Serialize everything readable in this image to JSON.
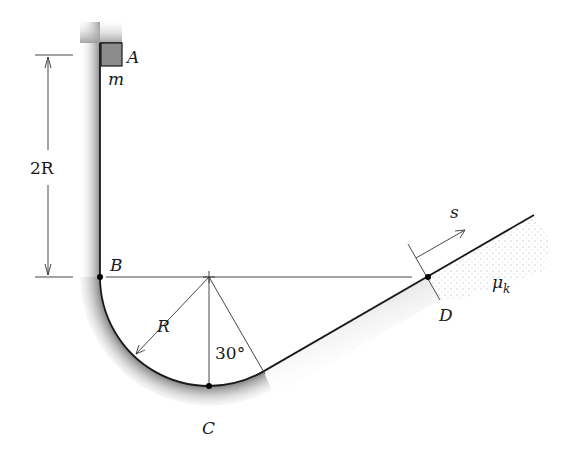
{
  "diagram": {
    "type": "mechanics-track",
    "labels": {
      "point_a": "A",
      "mass": "m",
      "point_b": "B",
      "point_c": "C",
      "point_d": "D",
      "height_dimension": "2R",
      "radius": "R",
      "angle": "30°",
      "distance": "s",
      "friction_coefficient": "μ",
      "friction_subscript": "k"
    },
    "colors": {
      "line": "#1a1a1a",
      "block_fill": "#8c8c8c",
      "shading": "#9a9a9a",
      "background": "#ffffff"
    }
  }
}
